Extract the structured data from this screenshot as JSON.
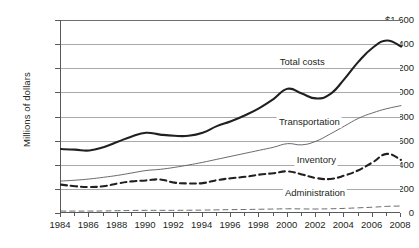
{
  "chart_data": {
    "type": "line",
    "title": "",
    "xlabel": "",
    "ylabel": "Millions of dollars",
    "xlim": [
      1984,
      2008
    ],
    "ylim": [
      0,
      1600
    ],
    "grid": true,
    "legend_position": "inline-right",
    "y_tick_labels": [
      "$1,600",
      "1,400",
      "1,200",
      "1,000",
      "800",
      "600",
      "400",
      "200",
      "0"
    ],
    "y_tick_values": [
      1600,
      1400,
      1200,
      1000,
      800,
      600,
      400,
      200,
      0
    ],
    "x_tick_labels": [
      "1984",
      "1986",
      "1988",
      "1990",
      "1992",
      "1994",
      "1996",
      "1998",
      "2000",
      "2002",
      "2004",
      "2006",
      "2008"
    ],
    "x_tick_values": [
      1984,
      1986,
      1988,
      1990,
      1992,
      1994,
      1996,
      1998,
      2000,
      2002,
      2004,
      2006,
      2008
    ],
    "x_minor_ticks": [
      1985,
      1987,
      1989,
      1991,
      1993,
      1995,
      1997,
      1999,
      2001,
      2003,
      2005,
      2007
    ],
    "x": [
      1984,
      1985,
      1986,
      1987,
      1988,
      1989,
      1990,
      1991,
      1992,
      1993,
      1994,
      1995,
      1996,
      1997,
      1998,
      1999,
      2000,
      2001,
      2002,
      2003,
      2004,
      2005,
      2006,
      2007,
      2008
    ],
    "series": [
      {
        "name": "Total costs",
        "style": "thick-solid",
        "color": "#231f20",
        "label_x": 2001.1,
        "label_y": 1245,
        "values": [
          530,
          525,
          518,
          545,
          590,
          635,
          665,
          650,
          640,
          640,
          665,
          720,
          760,
          810,
          870,
          945,
          1030,
          990,
          950,
          985,
          1110,
          1255,
          1370,
          1430,
          1380
        ]
      },
      {
        "name": "Transportation",
        "style": "thin-solid",
        "color": "#58595b",
        "label_x": 2001.6,
        "label_y": 745,
        "values": [
          265,
          272,
          282,
          296,
          312,
          332,
          352,
          362,
          378,
          398,
          420,
          445,
          470,
          495,
          520,
          545,
          575,
          565,
          595,
          655,
          720,
          785,
          830,
          865,
          890
        ]
      },
      {
        "name": "Inventory",
        "style": "thick-dashed",
        "color": "#231f20",
        "label_x": 2002.1,
        "label_y": 430,
        "values": [
          235,
          222,
          215,
          222,
          245,
          262,
          270,
          278,
          252,
          245,
          248,
          272,
          288,
          300,
          318,
          330,
          345,
          320,
          290,
          282,
          310,
          355,
          420,
          490,
          440
        ]
      },
      {
        "name": "Administration",
        "style": "thin-dashed",
        "color": "#58595b",
        "label_x": 2002.0,
        "label_y": 160,
        "values": [
          16,
          16,
          16,
          17,
          19,
          21,
          22,
          22,
          22,
          23,
          24,
          26,
          28,
          29,
          31,
          33,
          35,
          34,
          33,
          35,
          38,
          43,
          48,
          55,
          58
        ]
      }
    ]
  }
}
